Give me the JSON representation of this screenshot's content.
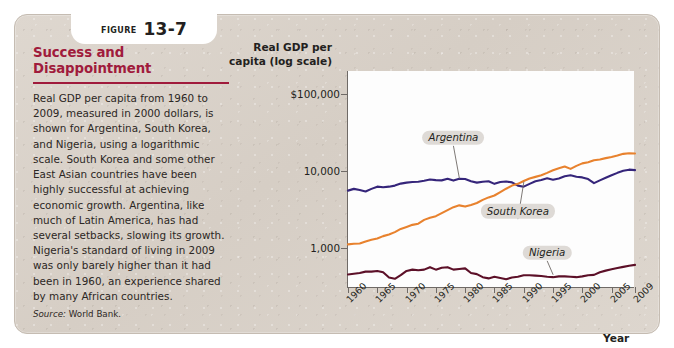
{
  "figure": {
    "badge_word": "Figure",
    "badge_number": "13-7",
    "title": "Success and Disappointment",
    "body": "Real GDP per capita from 1960 to 2009, measured in 2000 dollars, is shown for Argentina, South Korea, and Nigeria, using a logarithmic scale. South Korea and some other East Asian countries have been highly successful at achieving economic growth. Argentina, like much of Latin America, has had several setbacks, slowing its growth. Nigeria's standard of living in 2009 was only barely higher than it had been in 1960, an experience shared by many African countries.",
    "source_label": "Source:",
    "source_text": "World Bank."
  },
  "colors": {
    "title": "#a01b3c",
    "card": "#d9d1c9",
    "argentina": "#35257a",
    "south_korea": "#e8822e",
    "nigeria": "#5c1028",
    "axis": "#6f6a66",
    "label_box": "#dedad6"
  },
  "chart_data": {
    "type": "line",
    "title": "Success and Disappointment",
    "xlabel": "Year",
    "ylabel": "Real GDP per capita (log scale)",
    "ylabel_line1": "Real GDP per",
    "ylabel_line2": "capita (log scale)",
    "yscale": "log",
    "ylim": [
      300,
      200000
    ],
    "ytick_values": [
      100000,
      10000,
      1000
    ],
    "ytick_labels": [
      "$100,000",
      "10,000",
      "1,000"
    ],
    "xlim": [
      1960,
      2009
    ],
    "xtick_values": [
      1960,
      1965,
      1970,
      1975,
      1980,
      1985,
      1990,
      1995,
      2000,
      2005,
      2009
    ],
    "xtick_labels": [
      "1960",
      "1965",
      "1970",
      "1975",
      "1980",
      "1985",
      "1990",
      "1995",
      "2000",
      "2005",
      "2009"
    ],
    "grid": false,
    "legend": "inline-callout-labels",
    "x": [
      1960,
      1961,
      1962,
      1963,
      1964,
      1965,
      1966,
      1967,
      1968,
      1969,
      1970,
      1971,
      1972,
      1973,
      1974,
      1975,
      1976,
      1977,
      1978,
      1979,
      1980,
      1981,
      1982,
      1983,
      1984,
      1985,
      1986,
      1987,
      1988,
      1989,
      1990,
      1991,
      1992,
      1993,
      1994,
      1995,
      1996,
      1997,
      1998,
      1999,
      2000,
      2001,
      2002,
      2003,
      2004,
      2005,
      2006,
      2007,
      2008,
      2009
    ],
    "series": [
      {
        "name": "Argentina",
        "color": "#35257a",
        "label_x": 1978,
        "label_y": 27000,
        "values": [
          5550,
          5850,
          5650,
          5400,
          5850,
          6250,
          6150,
          6250,
          6450,
          6850,
          7050,
          7200,
          7250,
          7450,
          7750,
          7600,
          7550,
          7900,
          7500,
          7900,
          7850,
          7350,
          7050,
          7250,
          7350,
          6800,
          7200,
          7300,
          7100,
          6450,
          6250,
          6800,
          7350,
          7650,
          8050,
          7700,
          8000,
          8550,
          8800,
          8400,
          8250,
          7850,
          6950,
          7550,
          8150,
          8800,
          9450,
          10050,
          10400,
          10250
        ]
      },
      {
        "name": "South Korea",
        "color": "#e8822e",
        "label_x": 1989,
        "label_y": 3000,
        "values": [
          1110,
          1130,
          1140,
          1210,
          1270,
          1320,
          1420,
          1490,
          1600,
          1760,
          1870,
          1990,
          2060,
          2310,
          2460,
          2580,
          2830,
          3100,
          3380,
          3570,
          3440,
          3620,
          3830,
          4210,
          4530,
          4800,
          5310,
          5880,
          6450,
          6800,
          7400,
          8000,
          8380,
          8800,
          9450,
          10200,
          10850,
          11400,
          10650,
          11650,
          12550,
          13000,
          13800,
          14100,
          14700,
          15200,
          15900,
          16700,
          17000,
          16900
        ]
      },
      {
        "name": "Nigeria",
        "color": "#5c1028",
        "label_x": 1994,
        "label_y": 860,
        "values": [
          450,
          460,
          470,
          490,
          490,
          500,
          480,
          410,
          395,
          440,
          500,
          520,
          510,
          520,
          560,
          520,
          550,
          560,
          520,
          530,
          540,
          470,
          455,
          415,
          400,
          420,
          405,
          390,
          410,
          420,
          440,
          440,
          435,
          430,
          420,
          415,
          425,
          425,
          420,
          415,
          425,
          440,
          445,
          480,
          505,
          525,
          545,
          565,
          585,
          600
        ]
      }
    ]
  }
}
